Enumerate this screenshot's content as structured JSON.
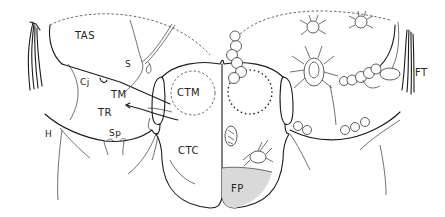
{
  "figure": {
    "type": "anatomical line drawing",
    "left_side_labels": [
      {
        "id": "TAS",
        "text": "TAS",
        "x": 75,
        "y": 31
      },
      {
        "id": "S",
        "text": "S",
        "x": 125,
        "y": 60
      },
      {
        "id": "Cj",
        "text": "Cj",
        "x": 80,
        "y": 78
      },
      {
        "id": "TM",
        "text": "TM",
        "x": 111,
        "y": 90
      },
      {
        "id": "TR",
        "text": "TR",
        "x": 98,
        "y": 108
      },
      {
        "id": "Sp",
        "text": "Sp",
        "x": 109,
        "y": 129
      },
      {
        "id": "H",
        "text": "H",
        "x": 45,
        "y": 130
      }
    ],
    "center_labels": [
      {
        "id": "CTM",
        "text": "CTM",
        "x": 177,
        "y": 88
      },
      {
        "id": "CTC",
        "text": "CTC",
        "x": 178,
        "y": 146
      },
      {
        "id": "FP",
        "text": "FP",
        "x": 231,
        "y": 184
      }
    ],
    "right_side_labels": [
      {
        "id": "FT",
        "text": "FT",
        "x": 415,
        "y": 68
      }
    ],
    "illustrated_elements": {
      "mites": 5,
      "egg_clusters": 4,
      "dotted_ring": "right chamber",
      "shaded_region": "FP"
    }
  }
}
